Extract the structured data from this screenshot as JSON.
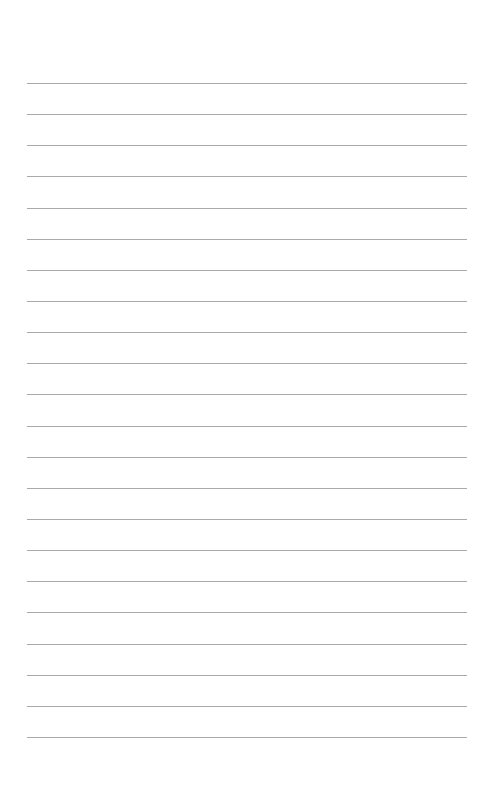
{
  "page": {
    "type": "lined-paper",
    "background_color": "#ffffff",
    "line_color": "#a9a9a9",
    "line_count": 22,
    "first_line_y": 83,
    "line_spacing": 31.14,
    "line_left": 27,
    "line_width": 440
  }
}
